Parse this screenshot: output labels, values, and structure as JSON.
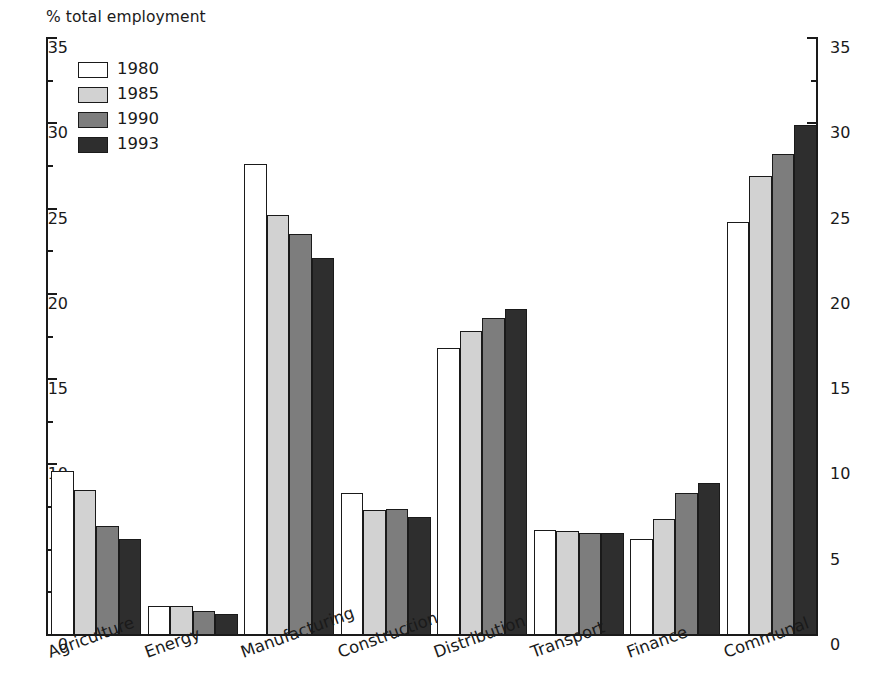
{
  "chart_data": {
    "type": "bar",
    "title": "",
    "ylabel": "% total employment",
    "xlabel": "",
    "ylim": [
      0,
      35
    ],
    "y_major_step": 5,
    "y_minor_step": 2.5,
    "grid": false,
    "legend_position": "top-left",
    "dual_y_axis": true,
    "categories": [
      "Agriculture",
      "Energy",
      "Manufacturing",
      "Construction",
      "Distribution",
      "Transport",
      "Finance",
      "Communal"
    ],
    "y_tick_labels": [
      "0",
      "5",
      "10",
      "15",
      "20",
      "25",
      "30",
      "35"
    ],
    "y_tick_values": [
      0,
      5,
      10,
      15,
      20,
      25,
      30,
      35
    ],
    "series": [
      {
        "name": "1980",
        "color": "#ffffff",
        "values": [
          9.6,
          1.7,
          27.6,
          8.3,
          16.8,
          6.15,
          5.6,
          24.2
        ]
      },
      {
        "name": "1985",
        "color": "#d2d2d2",
        "values": [
          8.5,
          1.7,
          24.6,
          7.3,
          17.8,
          6.1,
          6.8,
          26.9
        ]
      },
      {
        "name": "1990",
        "color": "#7d7d7d",
        "values": [
          6.4,
          1.4,
          23.5,
          7.4,
          18.6,
          6.0,
          8.3,
          28.2
        ]
      },
      {
        "name": "1993",
        "color": "#2e2e2e",
        "values": [
          5.6,
          1.25,
          22.1,
          6.9,
          19.1,
          6.0,
          8.9,
          29.9
        ]
      }
    ]
  },
  "legend": {
    "items": [
      {
        "label": "1980"
      },
      {
        "label": "1985"
      },
      {
        "label": "1990"
      },
      {
        "label": "1993"
      }
    ]
  }
}
